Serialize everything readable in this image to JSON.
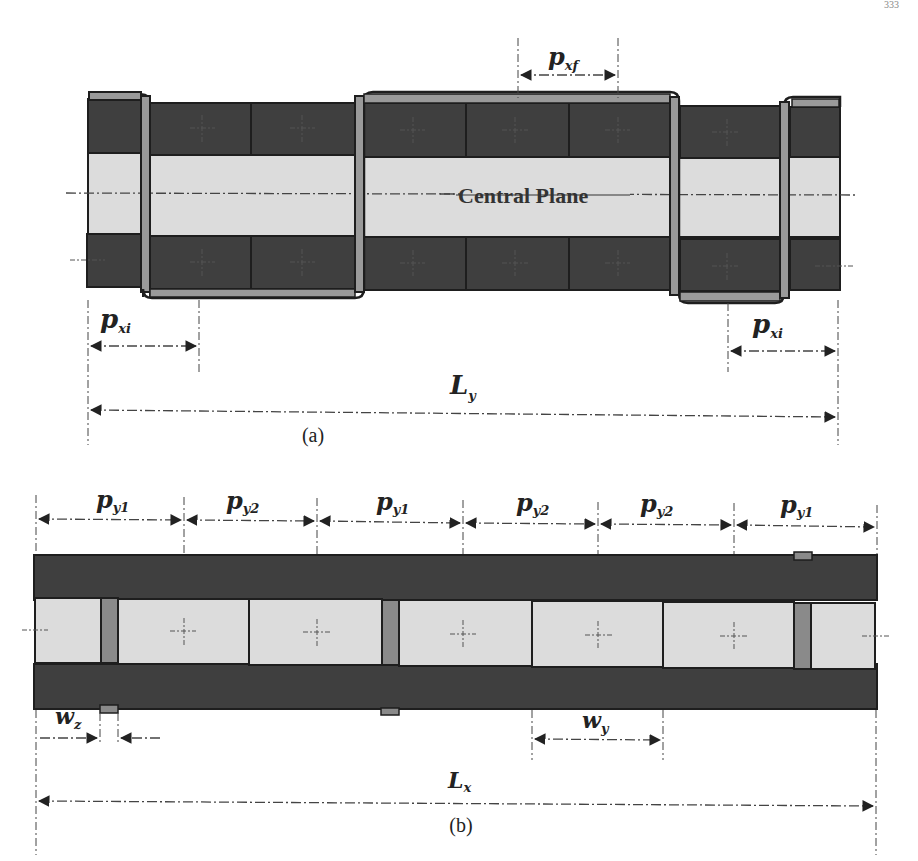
{
  "page_number": "333",
  "colors": {
    "dark_block": "#3f3f3f",
    "light_block": "#dcdcdc",
    "strap": "#9a9a9a",
    "outline": "#1e1e1e",
    "line": "#444444"
  },
  "figure_a": {
    "caption": "(a)",
    "center_label": "Central Plane",
    "labels": {
      "pxf": {
        "main": "p",
        "sub": "xf"
      },
      "pxi_left": {
        "main": "p",
        "sub": "xi"
      },
      "pxi_right": {
        "main": "p",
        "sub": "xi"
      },
      "Ly": {
        "main": "L",
        "sub": "y"
      }
    },
    "top_row_cells": 7,
    "bottom_row_cells": 7,
    "straps": 4
  },
  "figure_b": {
    "caption": "(b)",
    "pitch_labels": [
      {
        "main": "p",
        "sub": "y1"
      },
      {
        "main": "p",
        "sub": "y2"
      },
      {
        "main": "p",
        "sub": "y1"
      },
      {
        "main": "p",
        "sub": "y2"
      },
      {
        "main": "p",
        "sub": "y2"
      },
      {
        "main": "p",
        "sub": "y1"
      }
    ],
    "labels": {
      "wz": {
        "main": "w",
        "sub": "z"
      },
      "wy": {
        "main": "w",
        "sub": "y"
      },
      "Lx": {
        "main": "L",
        "sub": "x"
      }
    },
    "middle_cells": 6,
    "straps": 3
  }
}
